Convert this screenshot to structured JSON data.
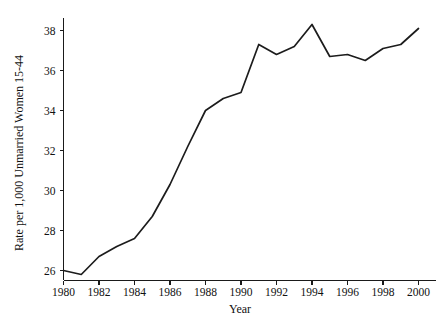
{
  "chart_data": {
    "type": "line",
    "title": "",
    "subtitle": "",
    "xlabel": "Year",
    "ylabel": "Rate per 1,000 Unmarried Women 15-44",
    "xlim": [
      1980,
      2000
    ],
    "ylim": [
      25.4,
      38.6
    ],
    "xticks": [
      1980,
      1982,
      1984,
      1986,
      1988,
      1990,
      1992,
      1994,
      1996,
      1998,
      2000
    ],
    "xtick_labels": [
      "1980",
      "1982",
      "1984",
      "1986",
      "1988",
      "1990",
      "1992",
      "1994",
      "1996",
      "1998",
      "2000"
    ],
    "yticks": [
      26,
      28,
      30,
      32,
      34,
      36,
      38
    ],
    "ytick_labels": [
      "26",
      "28",
      "30",
      "32",
      "34",
      "36",
      "38"
    ],
    "grid": false,
    "legend": false,
    "legend_position": "none",
    "line_color": "#1c1c1c",
    "x": [
      1980,
      1981,
      1982,
      1983,
      1984,
      1985,
      1986,
      1987,
      1988,
      1989,
      1990,
      1991,
      1992,
      1993,
      1994,
      1995,
      1996,
      1997,
      1998,
      1999,
      2000
    ],
    "values": [
      26.0,
      25.8,
      26.7,
      27.2,
      27.6,
      28.7,
      30.3,
      32.2,
      34.0,
      34.6,
      34.9,
      37.3,
      36.8,
      37.2,
      38.3,
      36.7,
      36.8,
      36.5,
      37.1,
      37.3,
      38.1
    ],
    "series": [
      {
        "name": "Birth rate for unmarried women",
        "values": [
          26.0,
          25.8,
          26.7,
          27.2,
          27.6,
          28.7,
          30.3,
          32.2,
          34.0,
          34.6,
          34.9,
          37.3,
          36.8,
          37.2,
          38.3,
          36.7,
          36.8,
          36.5,
          37.1,
          37.3,
          38.1
        ]
      }
    ]
  }
}
